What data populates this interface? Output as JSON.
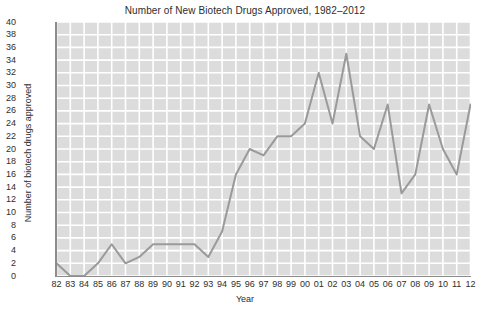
{
  "chart_data": {
    "type": "line",
    "title": "Number of New Biotech Drugs Approved, 1982–2012",
    "xlabel": "Year",
    "ylabel": "Number of biotech drugs approved",
    "categories": [
      "82",
      "83",
      "84",
      "85",
      "86",
      "87",
      "88",
      "89",
      "90",
      "91",
      "92",
      "93",
      "94",
      "95",
      "96",
      "97",
      "98",
      "99",
      "00",
      "01",
      "02",
      "03",
      "04",
      "05",
      "06",
      "07",
      "08",
      "09",
      "10",
      "11",
      "12"
    ],
    "values": [
      2,
      0,
      0,
      2,
      5,
      2,
      3,
      5,
      5,
      5,
      5,
      3,
      7,
      16,
      20,
      19,
      22,
      22,
      24,
      32,
      24,
      35,
      22,
      20,
      27,
      13,
      16,
      27,
      20,
      16,
      27
    ],
    "x_full_years": [
      1982,
      1983,
      1984,
      1985,
      1986,
      1987,
      1988,
      1989,
      1990,
      1991,
      1992,
      1993,
      1994,
      1995,
      1996,
      1997,
      1998,
      1999,
      2000,
      2001,
      2002,
      2003,
      2004,
      2005,
      2006,
      2007,
      2008,
      2009,
      2010,
      2011,
      2012
    ],
    "ylim": [
      0,
      40
    ],
    "ytick_step": 2,
    "yticks": [
      0,
      2,
      4,
      6,
      8,
      10,
      12,
      14,
      16,
      18,
      20,
      22,
      24,
      26,
      28,
      30,
      32,
      34,
      36,
      38,
      40
    ],
    "grid": true,
    "grid_color": "#ffffff",
    "plot_background": "#dcdcdc",
    "line_color": "#9a9a9a",
    "axis_color": "#8c8c8c",
    "legend": null,
    "legend_position": "none",
    "series": [
      {
        "name": "New biotech drugs approved",
        "values": [
          2,
          0,
          0,
          2,
          5,
          2,
          3,
          5,
          5,
          5,
          5,
          3,
          7,
          16,
          20,
          19,
          22,
          22,
          24,
          32,
          24,
          35,
          22,
          20,
          27,
          13,
          16,
          27,
          20,
          16,
          27
        ]
      }
    ]
  }
}
